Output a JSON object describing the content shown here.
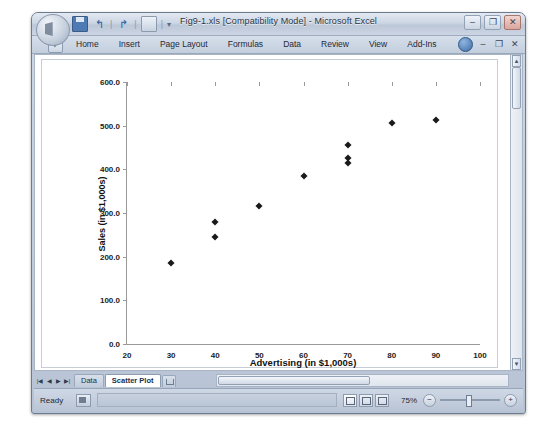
{
  "window": {
    "title": "Fig9-1.xls [Compatibility Mode] - Microsoft Excel",
    "minimize": "–",
    "restore": "❐",
    "close": "✕",
    "inner_minimize": "–",
    "inner_restore": "❐",
    "inner_close": "✕"
  },
  "quick_access": {
    "save_icon": "save-icon",
    "undo": "↰",
    "redo": "↱",
    "print_preview_icon": "print-preview-icon",
    "customize": "▾",
    "separator": "|"
  },
  "ribbon": {
    "tabs": [
      {
        "label": "Home"
      },
      {
        "label": "Insert"
      },
      {
        "label": "Page Layout"
      },
      {
        "label": "Formulas"
      },
      {
        "label": "Data"
      },
      {
        "label": "Review"
      },
      {
        "label": "View"
      },
      {
        "label": "Add-Ins"
      }
    ],
    "help_icon": "help-orb-icon",
    "collapse_icon": "–",
    "restore_icon": "❐",
    "close_icon": "✕"
  },
  "sheet_tabs": {
    "nav_first": "|◀",
    "nav_prev": "◀",
    "nav_next": "▶",
    "nav_last": "▶|",
    "items": [
      {
        "label": "Data",
        "active": false
      },
      {
        "label": "Scatter Plot",
        "active": true
      }
    ],
    "insert_sheet_icon": "insert-worksheet-icon"
  },
  "status_bar": {
    "ready": "Ready",
    "macro_record_icon": "record-macro-icon",
    "view_normal": "normal-view-icon",
    "view_page_layout": "page-layout-view-icon",
    "view_page_break": "page-break-view-icon",
    "zoom": "75%",
    "zoom_out": "−",
    "zoom_in": "+"
  },
  "chart_data": {
    "type": "scatter",
    "title": "",
    "xlabel": "Advertising  (in $1,000s)",
    "ylabel": "Sales (in $1,000s)",
    "xlim": [
      20,
      100
    ],
    "ylim": [
      0,
      600
    ],
    "xticks": [
      "20",
      "30",
      "40",
      "50",
      "60",
      "70",
      "80",
      "90",
      "100"
    ],
    "xtick_values": [
      20,
      30,
      40,
      50,
      60,
      70,
      80,
      90,
      100
    ],
    "yticks": [
      "0.0",
      "100.0",
      "200.0",
      "300.0",
      "400.0",
      "500.0",
      "600.0"
    ],
    "ytick_values": [
      0,
      100,
      200,
      300,
      400,
      500,
      600
    ],
    "grid": false,
    "legend": false,
    "marker": "diamond",
    "marker_color": "#1a1a1a",
    "points": [
      {
        "x": 30,
        "y": 185
      },
      {
        "x": 40,
        "y": 280
      },
      {
        "x": 40,
        "y": 245
      },
      {
        "x": 50,
        "y": 315
      },
      {
        "x": 60,
        "y": 385
      },
      {
        "x": 70,
        "y": 455
      },
      {
        "x": 70,
        "y": 425
      },
      {
        "x": 70,
        "y": 415
      },
      {
        "x": 80,
        "y": 507
      },
      {
        "x": 90,
        "y": 512
      }
    ]
  }
}
